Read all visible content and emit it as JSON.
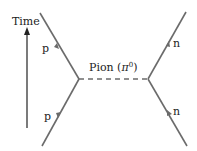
{
  "axis": {
    "label": "Time"
  },
  "particles": {
    "left_top": "p",
    "left_bottom": "p",
    "right_top": "n",
    "right_bottom": "n"
  },
  "exchange": {
    "label_prefix": "Pion (",
    "symbol": "π",
    "superscript": "0",
    "label_suffix": ")"
  },
  "colors": {
    "line": "#6b6b6b",
    "arrow": "#6b6b6b",
    "dash": "#6b6b6b",
    "text": "#222222"
  }
}
